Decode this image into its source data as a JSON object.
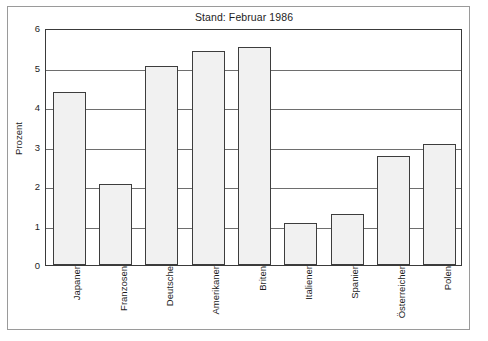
{
  "chart_data": {
    "type": "bar",
    "title": "Stand: Februar 1986",
    "xlabel": "",
    "ylabel": "Prozent",
    "ylim": [
      0,
      6
    ],
    "yticks": [
      0,
      1,
      2,
      3,
      4,
      5,
      6
    ],
    "ytick_labels": [
      "0",
      "1",
      "2",
      "3",
      "4",
      "5",
      "6"
    ],
    "grid": true,
    "legend": "none",
    "categories": [
      "Japaner",
      "Franzosen",
      "Deutsche",
      "Amerikaner",
      "Briten",
      "Italiener",
      "Spanier",
      "Österreicher",
      "Polen"
    ],
    "values": [
      4.37,
      2.05,
      5.05,
      5.42,
      5.53,
      1.07,
      1.28,
      2.75,
      3.06
    ],
    "bar_fill_color": "#f1f1f1",
    "bar_edge_color": "#3d3d3d",
    "gridline_color": "#6e6e6e",
    "axes_color": "#3a3a3a",
    "frame_color": "#9a9a9a",
    "background_color": "#ffffff"
  }
}
